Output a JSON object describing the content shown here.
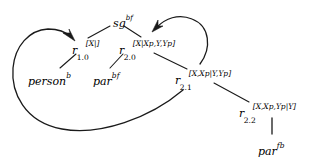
{
  "diagram": {
    "background": "#ffffff",
    "stroke": "#1a1a1a",
    "nodes": [
      {
        "id": "sg",
        "name": "node-sg",
        "base": "sg",
        "sup": "bf",
        "sub": "",
        "supbracket": "",
        "x": 113,
        "y": 14
      },
      {
        "id": "r10",
        "name": "node-r-1-0",
        "base": "r",
        "sup": "",
        "sub": "1.0",
        "supbracket": "[X|]",
        "x": 72,
        "y": 41
      },
      {
        "id": "r20",
        "name": "node-r-2-0",
        "base": "r",
        "sup": "",
        "sub": "2.0",
        "supbracket": "[X|Xp,Y,Yp]",
        "x": 119,
        "y": 41
      },
      {
        "id": "r21",
        "name": "node-r-2-1",
        "base": "r",
        "sup": "",
        "sub": "2.1",
        "supbracket": "[X,Xp|Y,Yp]",
        "x": 175,
        "y": 71
      },
      {
        "id": "r22",
        "name": "node-r-2-2",
        "base": "r",
        "sup": "",
        "sub": "2.2",
        "supbracket": "[X,Xp,Yp|Y]",
        "x": 239,
        "y": 104
      },
      {
        "id": "person",
        "name": "leaf-person",
        "base": "person",
        "sup": "b",
        "sub": "",
        "supbracket": "",
        "x": 28,
        "y": 72
      },
      {
        "id": "par_bf",
        "name": "leaf-par-bf",
        "base": "par",
        "sup": "bf",
        "sub": "",
        "supbracket": "",
        "x": 93,
        "y": 72
      },
      {
        "id": "par_fb",
        "name": "leaf-par-fb",
        "base": "par",
        "sup": "fb",
        "sub": "",
        "supbracket": "",
        "x": 258,
        "y": 142
      }
    ],
    "edges": [
      {
        "name": "edge-sg-to-r10",
        "from": "sg",
        "to": "r10",
        "kind": "line"
      },
      {
        "name": "edge-sg-to-r20",
        "from": "sg",
        "to": "r20",
        "kind": "line"
      },
      {
        "name": "edge-r10-to-person",
        "from": "r10",
        "to": "person",
        "kind": "line"
      },
      {
        "name": "edge-r20-to-par-bf",
        "from": "r20",
        "to": "par_bf",
        "kind": "line"
      },
      {
        "name": "edge-r20-to-r21",
        "from": "r20",
        "to": "r21",
        "kind": "line"
      },
      {
        "name": "edge-r21-to-r22",
        "from": "r21",
        "to": "r22",
        "kind": "line"
      },
      {
        "name": "edge-r22-to-par-fb",
        "from": "r22",
        "to": "par_fb",
        "kind": "line-vertical"
      },
      {
        "name": "edge-curve-r21-to-r10",
        "from": "r21",
        "to": "r10",
        "kind": "curved-arrow"
      },
      {
        "name": "edge-curve-r21-to-r20",
        "from": "r21",
        "to": "r20",
        "kind": "curved-arrow"
      }
    ]
  }
}
